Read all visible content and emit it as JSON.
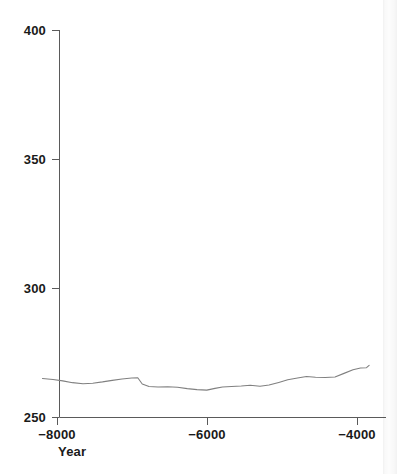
{
  "chart_data": {
    "type": "line",
    "title": "",
    "subtitle": "",
    "xlabel": "Year",
    "ylabel": "",
    "xlim": [
      -8200,
      -3840
    ],
    "ylim": [
      250,
      400
    ],
    "grid": false,
    "legend": false,
    "legend_position": "none",
    "x_ticks": [
      -8000,
      -6000,
      -4000
    ],
    "x_tick_labels": [
      "−8000",
      "−6000",
      "−4000"
    ],
    "y_ticks": [
      250,
      300,
      350,
      400
    ],
    "y_tick_labels": [
      "250",
      "300",
      "350",
      "400"
    ],
    "series": [
      {
        "name": "",
        "color": "#808080",
        "x": [
          -8200,
          -8060,
          -7930,
          -7800,
          -7660,
          -7530,
          -7400,
          -7270,
          -7140,
          -7010,
          -6930,
          -6870,
          -6780,
          -6660,
          -6530,
          -6400,
          -6270,
          -6140,
          -6010,
          -5900,
          -5800,
          -5680,
          -5550,
          -5430,
          -5300,
          -5180,
          -5050,
          -4930,
          -4800,
          -4680,
          -4560,
          -4430,
          -4300,
          -4180,
          -4060,
          -3960,
          -3880,
          -3845
        ],
        "y": [
          265.1,
          264.7,
          264.2,
          263.5,
          263.1,
          263.3,
          263.8,
          264.4,
          264.9,
          265.3,
          265.4,
          263.0,
          262.0,
          261.8,
          261.9,
          261.7,
          261.2,
          260.8,
          260.6,
          261.3,
          261.8,
          262.0,
          262.2,
          262.5,
          262.1,
          262.6,
          263.6,
          264.6,
          265.3,
          265.9,
          265.6,
          265.5,
          265.7,
          267.1,
          268.5,
          269.2,
          269.3,
          270.2
        ]
      }
    ]
  },
  "axis": {
    "x_title": "Year"
  }
}
